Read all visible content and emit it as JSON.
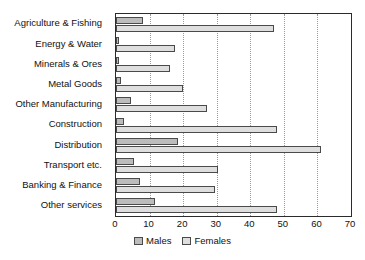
{
  "chart_data": {
    "type": "bar",
    "orientation": "horizontal",
    "title": "",
    "xlabel": "",
    "ylabel": "",
    "xlim": [
      0,
      70
    ],
    "xticks": [
      0,
      10,
      20,
      30,
      40,
      50,
      60,
      70
    ],
    "grid": "vertical-dotted",
    "legend_position": "bottom-center",
    "categories": [
      "Agriculture & Fishing",
      "Energy & Water",
      "Minerals & Ores",
      "Metal Goods",
      "Other Manufacturing",
      "Construction",
      "Distribution",
      "Transport etc.",
      "Banking & Finance",
      "Other services"
    ],
    "series": [
      {
        "name": "Males",
        "color": "#bcbcbc",
        "values": [
          8,
          1,
          1,
          1.5,
          4.5,
          2.5,
          18.5,
          5.5,
          7,
          11.5
        ]
      },
      {
        "name": "Females",
        "color": "#dedede",
        "values": [
          47,
          17.5,
          16,
          20,
          27,
          48,
          61,
          30.5,
          29.5,
          48
        ]
      }
    ]
  },
  "legend": {
    "items": [
      {
        "label": "Males"
      },
      {
        "label": "Females"
      }
    ]
  }
}
